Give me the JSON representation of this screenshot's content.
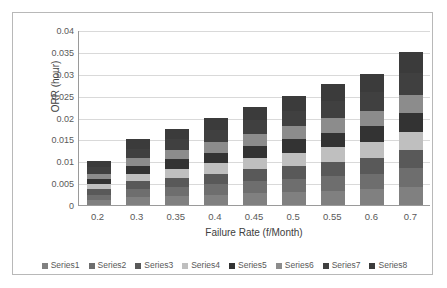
{
  "chart_data": {
    "type": "bar",
    "subtype": "stacked-bar",
    "title": "",
    "xlabel": "Failure Rate (f/Month)",
    "ylabel": "ORR (hour)",
    "categories": [
      "0.2",
      "0.3",
      "0.35",
      "0.4",
      "0.45",
      "0.5",
      "0.55",
      "0.6",
      "0.7"
    ],
    "ylim": [
      0,
      0.04
    ],
    "yticks": [
      "0",
      "0.005",
      "0.01",
      "0.015",
      "0.02",
      "0.025",
      "0.03",
      "0.035",
      "0.04"
    ],
    "ytick_values": [
      0,
      0.005,
      0.01,
      0.015,
      0.02,
      0.025,
      0.03,
      0.035,
      0.04
    ],
    "grid": true,
    "legend_position": "bottom",
    "totals": [
      0.01,
      0.015,
      0.0175,
      0.02,
      0.0225,
      0.025,
      0.0277,
      0.03,
      0.035
    ],
    "series": [
      {
        "name": "Series1",
        "color": "#808080",
        "values": [
          0.0012,
          0.0018,
          0.0021,
          0.0024,
          0.0027,
          0.003,
          0.0033,
          0.0036,
          0.0042
        ]
      },
      {
        "name": "Series2",
        "color": "#6e6e6e",
        "values": [
          0.0012,
          0.0018,
          0.0021,
          0.0024,
          0.0027,
          0.003,
          0.0033,
          0.0036,
          0.0042
        ]
      },
      {
        "name": "Series3",
        "color": "#595959",
        "values": [
          0.0012,
          0.0018,
          0.0021,
          0.0024,
          0.0027,
          0.003,
          0.0033,
          0.0036,
          0.0042
        ]
      },
      {
        "name": "Series4",
        "color": "#bfbfbf",
        "values": [
          0.0012,
          0.0018,
          0.0021,
          0.0024,
          0.0027,
          0.003,
          0.0033,
          0.0036,
          0.0042
        ]
      },
      {
        "name": "Series5",
        "color": "#333333",
        "values": [
          0.0012,
          0.0018,
          0.0021,
          0.0024,
          0.0027,
          0.003,
          0.0033,
          0.0036,
          0.0042
        ]
      },
      {
        "name": "Series6",
        "color": "#8c8c8c",
        "values": [
          0.0012,
          0.0018,
          0.0021,
          0.0024,
          0.0027,
          0.003,
          0.0033,
          0.0036,
          0.0042
        ]
      },
      {
        "name": "Series7",
        "color": "#404040",
        "values": [
          0.0014,
          0.0021,
          0.0025,
          0.0028,
          0.0031,
          0.0035,
          0.0039,
          0.0042,
          0.0049
        ]
      },
      {
        "name": "Series8",
        "color": "#3b3b3b",
        "values": [
          0.0014,
          0.0021,
          0.0025,
          0.0028,
          0.0031,
          0.0035,
          0.0039,
          0.0042,
          0.0049
        ]
      }
    ]
  },
  "legend": {
    "items": [
      {
        "label": "Series1"
      },
      {
        "label": "Series2"
      },
      {
        "label": "Series3"
      },
      {
        "label": "Series4"
      },
      {
        "label": "Series5"
      },
      {
        "label": "Series6"
      },
      {
        "label": "Series7"
      },
      {
        "label": "Series8"
      }
    ]
  },
  "colors": {
    "frame_border": "#b8b8b8",
    "gridline": "#d9d9d9",
    "axis": "#9a9a9a",
    "tick_text": "#595959",
    "axis_title_text": "#404040",
    "background": "#ffffff"
  }
}
